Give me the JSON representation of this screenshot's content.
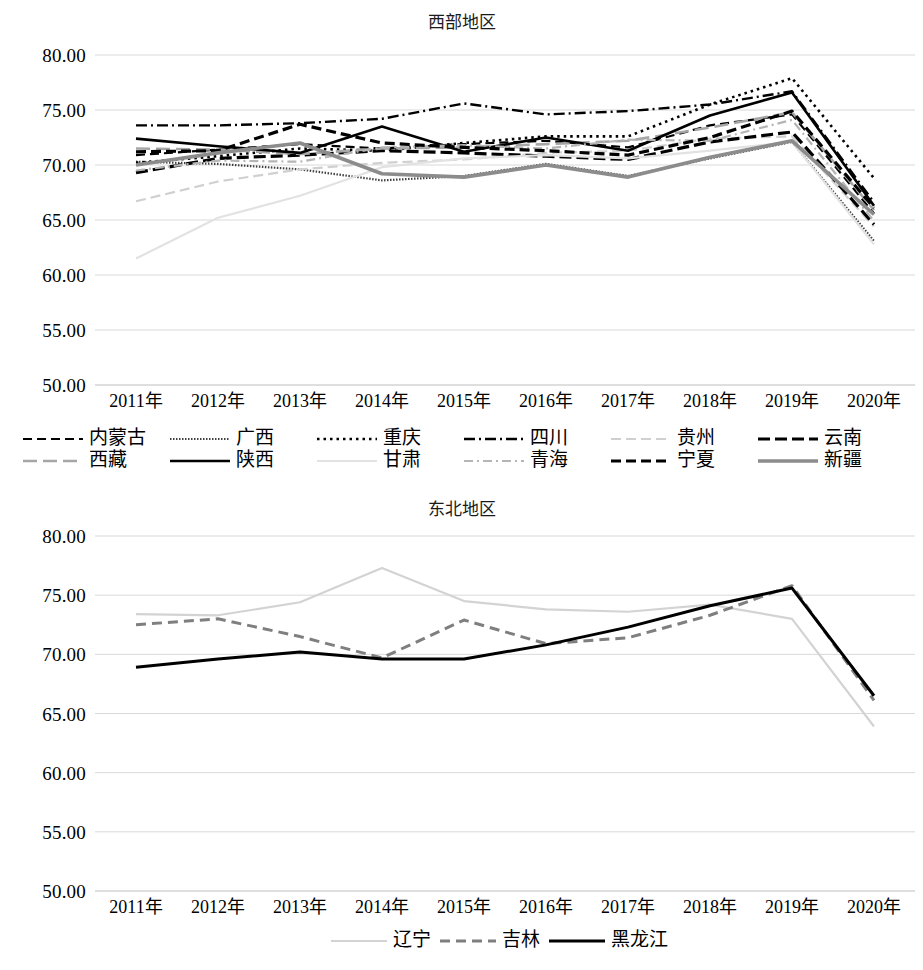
{
  "charts": [
    {
      "id": "west",
      "title": "西部地区",
      "chart_ref": 0
    },
    {
      "id": "northeast",
      "title": "东北地区",
      "chart_ref": 1
    }
  ],
  "chart_data": [
    {
      "type": "line",
      "title": "西部地区",
      "xlabel": "",
      "ylabel": "",
      "categories": [
        "2011年",
        "2012年",
        "2013年",
        "2014年",
        "2015年",
        "2016年",
        "2017年",
        "2018年",
        "2019年",
        "2020年"
      ],
      "ylim": [
        50.0,
        80.0
      ],
      "yticks": [
        "50.00",
        "55.00",
        "60.00",
        "65.00",
        "70.00",
        "75.00",
        "80.00"
      ],
      "grid": true,
      "legend_position": "bottom",
      "series": [
        {
          "name": "内蒙古",
          "style": "dashed",
          "color": "#000000",
          "width": 2.2,
          "dash": "9,5",
          "values": [
            70.9,
            71.4,
            71.9,
            71.5,
            71.9,
            72.2,
            71.6,
            73.6,
            74.6,
            65.6
          ]
        },
        {
          "name": "广西",
          "style": "dotted",
          "color": "#404040",
          "width": 2.2,
          "dash": "1.5,1.5",
          "values": [
            70.3,
            70.1,
            69.6,
            68.6,
            69.0,
            70.1,
            69.0,
            70.6,
            72.1,
            63.1
          ]
        },
        {
          "name": "重庆",
          "style": "dotted",
          "color": "#000000",
          "width": 2.6,
          "dash": "2.5,4",
          "values": [
            70.2,
            70.8,
            71.5,
            71.3,
            72.0,
            72.6,
            72.6,
            75.5,
            77.9,
            68.8
          ]
        },
        {
          "name": "四川",
          "style": "dashdot",
          "color": "#000000",
          "width": 2.4,
          "dash": "11,4,2,4",
          "values": [
            73.6,
            73.6,
            73.8,
            74.2,
            75.6,
            74.6,
            74.9,
            75.5,
            76.7,
            66.6
          ]
        },
        {
          "name": "贵州",
          "style": "dashed",
          "color": "#d0d0d0",
          "width": 2.2,
          "dash": "10,5",
          "values": [
            66.7,
            68.5,
            69.6,
            70.2,
            70.5,
            71.1,
            71.3,
            72.4,
            72.6,
            64.4
          ]
        },
        {
          "name": "云南",
          "style": "dashed",
          "color": "#000000",
          "width": 3.2,
          "dash": "12,5",
          "values": [
            69.3,
            70.6,
            70.9,
            71.3,
            71.1,
            70.8,
            70.5,
            72.1,
            73.0,
            64.6
          ]
        },
        {
          "name": "西藏",
          "style": "dashed",
          "color": "#a6a6a6",
          "width": 2.6,
          "dash": "14,6",
          "values": [
            71.5,
            71.4,
            71.0,
            71.5,
            71.6,
            71.9,
            72.2,
            73.4,
            74.8,
            65.9
          ]
        },
        {
          "name": "陕西",
          "style": "solid",
          "color": "#000000",
          "width": 2.6,
          "dash": "",
          "values": [
            72.4,
            71.7,
            71.1,
            73.5,
            71.2,
            72.5,
            71.3,
            74.5,
            76.6,
            66.3
          ]
        },
        {
          "name": "甘肃",
          "style": "solid",
          "color": "#e2e2e2",
          "width": 2.2,
          "dash": "",
          "values": [
            61.5,
            65.2,
            67.2,
            69.8,
            70.6,
            70.9,
            70.6,
            71.3,
            72.1,
            62.8
          ]
        },
        {
          "name": "青海",
          "style": "dashdot",
          "color": "#b5b5b5",
          "width": 2.2,
          "dash": "9,4,2,4",
          "values": [
            69.5,
            70.4,
            70.3,
            71.6,
            71.8,
            71.5,
            72.3,
            72.2,
            74.1,
            64.9
          ]
        },
        {
          "name": "宁夏",
          "style": "dashed",
          "color": "#000000",
          "width": 3.2,
          "dash": "10,5",
          "values": [
            71.2,
            71.3,
            73.7,
            72.0,
            71.6,
            71.3,
            70.9,
            72.5,
            74.9,
            66.1
          ]
        },
        {
          "name": "新疆",
          "style": "solid",
          "color": "#8c8c8c",
          "width": 3.6,
          "dash": "",
          "values": [
            70.0,
            71.1,
            72.0,
            69.2,
            68.9,
            70.0,
            68.9,
            70.7,
            72.2,
            65.5
          ]
        }
      ]
    },
    {
      "type": "line",
      "title": "东北地区",
      "xlabel": "",
      "ylabel": "",
      "categories": [
        "2011年",
        "2012年",
        "2013年",
        "2014年",
        "2015年",
        "2016年",
        "2017年",
        "2018年",
        "2019年",
        "2020年"
      ],
      "ylim": [
        50.0,
        80.0
      ],
      "yticks": [
        "50.00",
        "55.00",
        "60.00",
        "65.00",
        "70.00",
        "75.00",
        "80.00"
      ],
      "grid": true,
      "legend_position": "bottom",
      "series": [
        {
          "name": "辽宁",
          "style": "solid",
          "color": "#d3d3d3",
          "width": 2.2,
          "dash": "",
          "values": [
            73.4,
            73.3,
            74.4,
            77.3,
            74.5,
            73.8,
            73.6,
            74.2,
            73.0,
            63.9
          ]
        },
        {
          "name": "吉林",
          "style": "dashed",
          "color": "#7f7f7f",
          "width": 3.0,
          "dash": "10,6",
          "values": [
            72.5,
            73.0,
            71.5,
            69.7,
            72.9,
            70.9,
            71.4,
            73.3,
            75.8,
            66.1
          ]
        },
        {
          "name": "黑龙江",
          "style": "solid",
          "color": "#000000",
          "width": 3.0,
          "dash": "",
          "values": [
            68.9,
            69.6,
            70.2,
            69.6,
            69.6,
            70.8,
            72.3,
            74.1,
            75.6,
            66.5
          ]
        }
      ]
    }
  ]
}
